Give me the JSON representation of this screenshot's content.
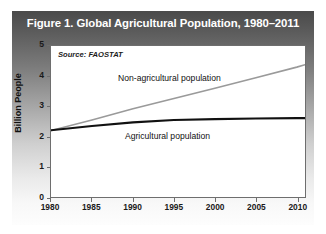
{
  "figure": {
    "title": "Figure 1. Global Agricultural Population, 1980–2011",
    "source_note": "Source: FAOSTAT",
    "title_color": "#ffffff",
    "panel_dark": "#4a4a4a",
    "panel_light": "#fdfdfd",
    "plot_background": "#ffffff",
    "frame_color": "#6e6e6e"
  },
  "chart_data": {
    "type": "line",
    "title": "Figure 1. Global Agricultural Population, 1980–2011",
    "subtitle": "",
    "xlabel": "",
    "ylabel": "Billion People",
    "annotation": "Source: FAOSTAT",
    "grid": false,
    "legend_position": "inline-labels",
    "xlim": [
      1980,
      2011
    ],
    "ylim": [
      0,
      5
    ],
    "xticks": [
      1980,
      1985,
      1990,
      1995,
      2000,
      2005,
      2010
    ],
    "xtick_labels": [
      "1980",
      "1985",
      "1990",
      "1995",
      "2000",
      "2005",
      "2010"
    ],
    "yticks": [
      0,
      1,
      2,
      3,
      4,
      5
    ],
    "ytick_labels": [
      "0",
      "1",
      "2",
      "3",
      "4",
      "5"
    ],
    "x": [
      1980,
      1985,
      1990,
      1995,
      2000,
      2005,
      2010,
      2011
    ],
    "series": [
      {
        "name": "Non-agricultural population",
        "color": "#9a9a9a",
        "width": 1.6,
        "values": [
          2.2,
          2.55,
          2.92,
          3.26,
          3.6,
          3.95,
          4.3,
          4.38
        ]
      },
      {
        "name": "Agricultural population",
        "color": "#111111",
        "width": 2.2,
        "values": [
          2.21,
          2.35,
          2.47,
          2.55,
          2.58,
          2.6,
          2.61,
          2.61
        ]
      }
    ]
  },
  "labels": {
    "nonagricultural": "Non-agricultural population",
    "agricultural": "Agricultural population",
    "yaxis_title": "Billion People"
  }
}
